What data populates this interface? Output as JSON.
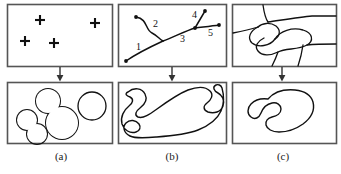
{
  "figure": {
    "title": "",
    "type": "process-diagram",
    "stroke_color": "#1a1a1a",
    "frame_color": "#555555",
    "background": "#ffffff"
  },
  "columns": [
    {
      "id": "a",
      "caption": "(a)",
      "top_panel": {
        "name": "point-seeds-panel",
        "content": "plus markers",
        "markers": [
          {
            "label": "+",
            "x": 40,
            "y": 20
          },
          {
            "label": "+",
            "x": 95,
            "y": 23
          },
          {
            "label": "+",
            "x": 25,
            "y": 41
          },
          {
            "label": "+",
            "x": 54,
            "y": 43
          }
        ]
      },
      "bottom_panel": {
        "name": "circular-regions-panel",
        "content": "merged circular blob and separate circle",
        "shapes": [
          {
            "type": "circle",
            "cx": 48,
            "cy": 101,
            "r": 13
          },
          {
            "type": "circle",
            "cx": 27,
            "cy": 120,
            "r": 11
          },
          {
            "type": "circle",
            "cx": 37,
            "cy": 134,
            "r": 11
          },
          {
            "type": "circle",
            "cx": 62,
            "cy": 123,
            "r": 17
          },
          {
            "type": "circle",
            "cx": 92,
            "cy": 106,
            "r": 14
          }
        ]
      }
    },
    {
      "id": "b",
      "caption": "(b)",
      "top_panel": {
        "name": "curve-skeleton-panel",
        "content": "numbered branching curve with endpoint dots",
        "branch_labels": [
          {
            "label": "1",
            "x": 136,
            "y": 47
          },
          {
            "label": "2",
            "x": 154,
            "y": 24
          },
          {
            "label": "3",
            "x": 181,
            "y": 38
          },
          {
            "label": "4",
            "x": 194,
            "y": 16
          },
          {
            "label": "5",
            "x": 209,
            "y": 32
          }
        ],
        "endpoints": [
          {
            "x": 126,
            "y": 61
          },
          {
            "x": 136,
            "y": 17
          },
          {
            "x": 205,
            "y": 11
          },
          {
            "x": 219,
            "y": 25
          }
        ],
        "junctions": [
          {
            "x": 163,
            "y": 41
          },
          {
            "x": 195,
            "y": 28
          }
        ]
      },
      "bottom_panel": {
        "name": "elongated-region-panel",
        "content": "single large irregular elongated outline"
      }
    },
    {
      "id": "c",
      "caption": "(c)",
      "top_panel": {
        "name": "edge-map-panel",
        "content": "region boundary edges partitioning the frame"
      },
      "bottom_panel": {
        "name": "kidney-region-panel",
        "content": "single smooth kidney-shaped outline"
      }
    }
  ],
  "arrows": [
    {
      "name": "arrow-a",
      "x": 60,
      "from_y": 67,
      "to_y": 81
    },
    {
      "name": "arrow-b",
      "x": 172,
      "from_y": 67,
      "to_y": 81
    },
    {
      "name": "arrow-c",
      "x": 282,
      "from_y": 67,
      "to_y": 81
    }
  ]
}
